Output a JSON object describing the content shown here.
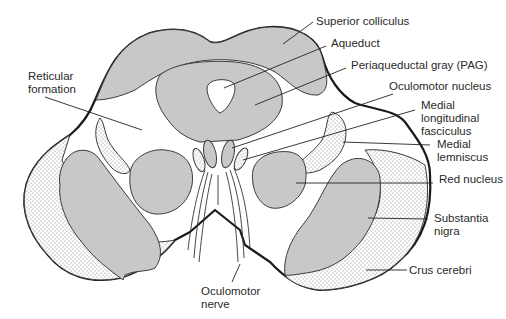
{
  "diagram": {
    "colors": {
      "gray_matter": "#c8c8c8",
      "outline": "#1a1a1a",
      "stipple_dot": "#777777",
      "background": "#ffffff"
    },
    "labels": {
      "superior_colliculus": "Superior colliculus",
      "aqueduct": "Aqueduct",
      "pag": "Periaqueductal gray (PAG)",
      "oculomotor_nucleus": "Oculomotor nucleus",
      "mlf_line1": "Medial",
      "mlf_line2": "longitudinal",
      "mlf_line3": "fasciculus",
      "ml_line1": "Medial",
      "ml_line2": "lemniscus",
      "red_nucleus": "Red nucleus",
      "sn_line1": "Substantia",
      "sn_line2": "nigra",
      "crus_cerebri": "Crus cerebri",
      "reticular_line1": "Reticular",
      "reticular_line2": "formation",
      "oculomotor_nerve_line1": "Oculomotor",
      "oculomotor_nerve_line2": "nerve"
    }
  }
}
